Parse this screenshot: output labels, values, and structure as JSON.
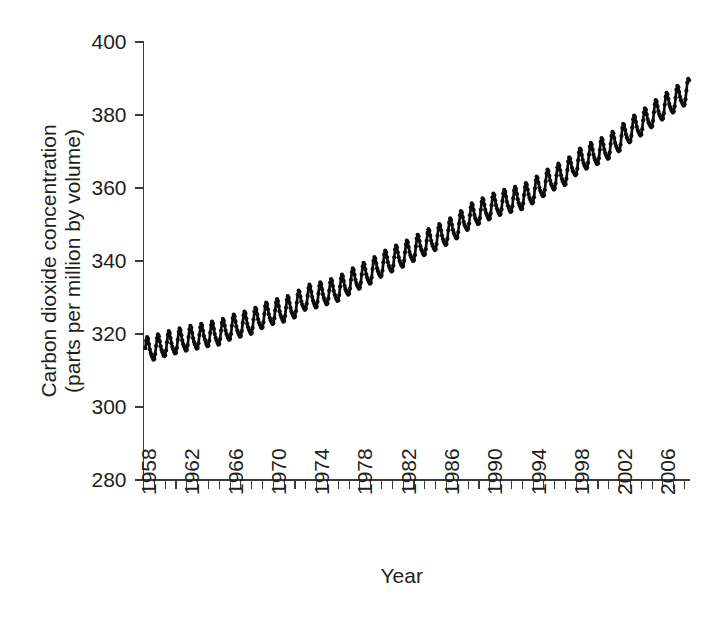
{
  "chart_data": {
    "type": "line",
    "title": "",
    "subtitle": "",
    "xlabel": "Year",
    "ylabel": "Carbon dioxide concentration (parts per million by volume)",
    "ylabel_line1": "Carbon dioxide concentration",
    "ylabel_line2": "(parts per million by volume)",
    "xlim": [
      1958,
      2008.5
    ],
    "ylim": [
      280,
      400
    ],
    "yticks": [
      280,
      300,
      320,
      340,
      360,
      380,
      400
    ],
    "ytick_labels": [
      "280",
      "300",
      "320",
      "340",
      "360",
      "380",
      "400"
    ],
    "xticks": [
      1958,
      1962,
      1966,
      1970,
      1974,
      1978,
      1982,
      1986,
      1990,
      1994,
      1998,
      2002,
      2006
    ],
    "xtick_labels": [
      "1958",
      "1962",
      "1966",
      "1970",
      "1974",
      "1978",
      "1982",
      "1986",
      "1990",
      "1994",
      "1998",
      "2002",
      "2006"
    ],
    "xtick_minor_interval": 1,
    "grid": false,
    "legend": null,
    "legend_position": "none",
    "series_name": "Atmospheric CO2 (Mauna Loa monthly mean)",
    "line_color": "#0d0d0d",
    "marker": "circle",
    "seasonal_amplitude": 3.1,
    "seasonal_peak_month": 5,
    "annual_mean": {
      "x": [
        1958,
        1959,
        1960,
        1961,
        1962,
        1963,
        1964,
        1965,
        1966,
        1967,
        1968,
        1969,
        1970,
        1971,
        1972,
        1973,
        1974,
        1975,
        1976,
        1977,
        1978,
        1979,
        1980,
        1981,
        1982,
        1983,
        1984,
        1985,
        1986,
        1987,
        1988,
        1989,
        1990,
        1991,
        1992,
        1993,
        1994,
        1995,
        1996,
        1997,
        1998,
        1999,
        2000,
        2001,
        2002,
        2003,
        2004,
        2005,
        2006,
        2007,
        2008
      ],
      "y": [
        315.3,
        315.9,
        316.9,
        317.6,
        318.4,
        318.9,
        319.6,
        320.0,
        321.4,
        322.2,
        323.0,
        324.6,
        325.7,
        326.3,
        327.5,
        329.7,
        330.2,
        331.1,
        332.0,
        333.8,
        335.4,
        336.8,
        338.7,
        340.1,
        341.4,
        343.0,
        344.6,
        346.0,
        347.4,
        349.2,
        351.6,
        353.1,
        354.4,
        355.6,
        356.4,
        357.1,
        358.8,
        360.8,
        362.6,
        363.8,
        366.6,
        368.3,
        369.5,
        371.0,
        373.1,
        375.6,
        377.4,
        379.7,
        381.8,
        383.7,
        385.6
      ]
    }
  },
  "figure": {
    "axes": {
      "y_axis_name": "y-axis",
      "x_axis_name": "x-axis"
    }
  }
}
